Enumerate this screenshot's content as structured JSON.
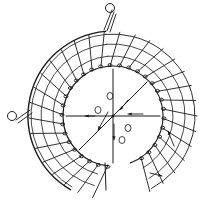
{
  "figure": {
    "description": "Hand-drawn plan sketch of a spiral staircase",
    "colors": {
      "ink": "#1a1a1a",
      "paper": "#ffffff"
    },
    "center": [
      113,
      116
    ],
    "outer_radius": 85,
    "inner_radius": 50,
    "mid_radii": [
      60,
      72
    ],
    "arc_start_deg": -95,
    "arc_end_deg": 165,
    "inner_ring_extends_to_deg": 200,
    "tread_count": 30,
    "arrows": [
      {
        "from": [
          108,
          112
        ],
        "to": [
          98,
          130
        ],
        "label": "down-left"
      },
      {
        "from": [
          128,
          100
        ],
        "to": [
          120,
          110
        ],
        "label": "in"
      },
      {
        "from": [
          143,
          114
        ],
        "to": [
          128,
          114
        ],
        "label": "left"
      },
      {
        "from": [
          114,
          124
        ],
        "to": [
          114,
          140
        ],
        "label": "down"
      },
      {
        "from": [
          95,
          116
        ],
        "to": [
          85,
          116
        ],
        "label": "left"
      },
      {
        "from": [
          174,
          146
        ],
        "to": [
          168,
          131
        ],
        "label": "up"
      },
      {
        "from": [
          150,
          173
        ],
        "to": [
          162,
          176
        ],
        "label": "right"
      }
    ],
    "hand_rail_curls": [
      [
        110,
        8
      ],
      [
        12,
        116
      ]
    ]
  }
}
